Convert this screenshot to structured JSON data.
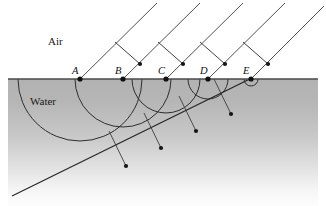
{
  "figure": {
    "width": 326,
    "height": 206,
    "background_color": "#ffffff"
  },
  "media": {
    "upper": {
      "label": "Air",
      "label_x": 48,
      "label_y": 45,
      "fill_color": "#ffffff"
    },
    "lower": {
      "label": "Water",
      "label_x": 30,
      "label_y": 105,
      "fill_top_color": "#b3b3b3",
      "fill_bottom_color": "#fdfdfd"
    }
  },
  "interface": {
    "name": "water-surface",
    "y": 79,
    "x_start": 8,
    "x_end": 318,
    "color": "#4a4a4a"
  },
  "incidence_points": [
    {
      "label": "A",
      "x": 80,
      "y": 79,
      "label_x": 72,
      "label_y": 73
    },
    {
      "label": "B",
      "x": 123,
      "y": 79,
      "label_x": 115,
      "label_y": 73
    },
    {
      "label": "C",
      "x": 166,
      "y": 79,
      "label_x": 158,
      "label_y": 73
    },
    {
      "label": "D",
      "x": 208,
      "y": 79,
      "label_x": 200,
      "label_y": 73
    },
    {
      "label": "E",
      "x": 251,
      "y": 79,
      "label_x": 243,
      "label_y": 73
    }
  ],
  "incident_rays": [
    {
      "name": "incident-ray-A",
      "x1": 157,
      "y1": 3,
      "x2": 80,
      "y2": 79
    },
    {
      "name": "incident-ray-B",
      "x1": 200,
      "y1": 3,
      "x2": 123,
      "y2": 79
    },
    {
      "name": "incident-ray-C",
      "x1": 243,
      "y1": 3,
      "x2": 166,
      "y2": 79
    },
    {
      "name": "incident-ray-D",
      "x1": 285,
      "y1": 3,
      "x2": 208,
      "y2": 79
    },
    {
      "name": "incident-ray-E",
      "x1": 324,
      "y1": 6,
      "x2": 251,
      "y2": 79
    }
  ],
  "incident_wavefront_arrows": [
    {
      "name": "wavefront-arrow-1",
      "x1": 115,
      "y1": 42,
      "x2": 140,
      "y2": 64
    },
    {
      "name": "wavefront-arrow-2",
      "x1": 158,
      "y1": 42,
      "x2": 183,
      "y2": 64
    },
    {
      "name": "wavefront-arrow-3",
      "x1": 200,
      "y1": 42,
      "x2": 225,
      "y2": 64
    },
    {
      "name": "wavefront-arrow-4",
      "x1": 243,
      "y1": 42,
      "x2": 268,
      "y2": 64
    }
  ],
  "huygens_wavelets": [
    {
      "name": "wavelet-A",
      "cx": 80,
      "cy": 79,
      "r": 62
    },
    {
      "name": "wavelet-B",
      "cx": 123,
      "cy": 79,
      "r": 48
    },
    {
      "name": "wavelet-C",
      "cx": 166,
      "cy": 79,
      "r": 34
    },
    {
      "name": "wavelet-D",
      "cx": 208,
      "cy": 79,
      "r": 20
    },
    {
      "name": "wavelet-E",
      "cx": 251,
      "cy": 79,
      "r": 7
    }
  ],
  "refracted_wavefront": {
    "name": "refracted-wavefront-tangent",
    "x1": 12,
    "y1": 196,
    "x2": 262,
    "y2": 73
  },
  "refracted_rays": [
    {
      "name": "refracted-ray-A",
      "x1": 109,
      "y1": 131,
      "x2": 126,
      "y2": 166
    },
    {
      "name": "refracted-ray-B",
      "x1": 144,
      "y1": 113,
      "x2": 161,
      "y2": 148
    },
    {
      "name": "refracted-ray-C",
      "x1": 179,
      "y1": 96,
      "x2": 196,
      "y2": 131
    },
    {
      "name": "refracted-ray-D",
      "x1": 214,
      "y1": 79,
      "x2": 231,
      "y2": 114
    }
  ],
  "legend": {
    "incident_label": "Air",
    "refracted_label": "Water"
  }
}
